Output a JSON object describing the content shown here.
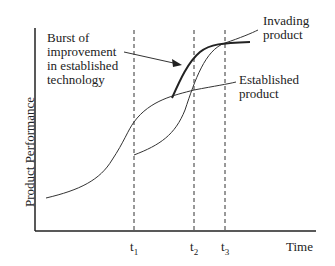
{
  "diagram": {
    "ylabel": "Product Performance",
    "xlabel": "Time",
    "annotations": {
      "burst": [
        "Burst of",
        "improvement",
        "in established",
        "technology"
      ],
      "invading": [
        "Invading",
        "product"
      ],
      "established": [
        "Established",
        "product"
      ]
    },
    "ticks": [
      {
        "base": "t",
        "sub": "1"
      },
      {
        "base": "t",
        "sub": "2"
      },
      {
        "base": "t",
        "sub": "3"
      }
    ]
  }
}
